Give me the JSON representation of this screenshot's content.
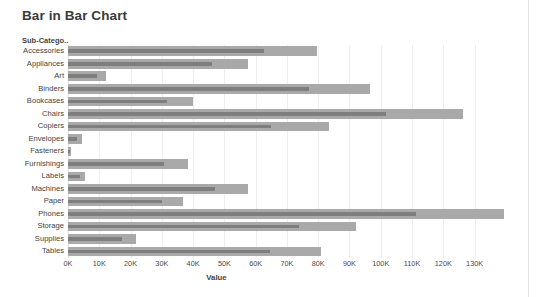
{
  "window": {
    "background": "#ffffff",
    "frame_border_color": "#e3e3e3"
  },
  "header": {
    "title": "Bar in Bar Chart"
  },
  "axis": {
    "category_header": "Sub-Catego..",
    "value_axis_title": "Value"
  },
  "colors": {
    "outer_bar": "#a9a9a9",
    "inner_bar": "#7e7e7e",
    "gridline": "#eceff1",
    "text": "#3f3f3f",
    "title_text": "#3b3b3b"
  },
  "chart_data": {
    "type": "bar",
    "orientation": "horizontal",
    "title": "Bar in Bar Chart",
    "xlabel": "Value",
    "ylabel": "Sub-Catego..",
    "xlim": [
      0,
      141000
    ],
    "grid": true,
    "legend": "none",
    "tick_labels": [
      "0K",
      "10K",
      "20K",
      "30K",
      "40K",
      "50K",
      "60K",
      "70K",
      "80K",
      "90K",
      "100K",
      "110K",
      "120K",
      "130K"
    ],
    "tick_values": [
      0,
      10000,
      20000,
      30000,
      40000,
      50000,
      60000,
      70000,
      80000,
      90000,
      100000,
      110000,
      120000,
      130000
    ],
    "categories": [
      "Accessories",
      "Appliances",
      "Art",
      "Binders",
      "Bookcases",
      "Chairs",
      "Copiers",
      "Envelopes",
      "Fasteners",
      "Furnishings",
      "Labels",
      "Machines",
      "Paper",
      "Phones",
      "Storage",
      "Supplies",
      "Tables"
    ],
    "series": [
      {
        "name": "Outer bar",
        "color": "#a9a9a9",
        "values": [
          79500,
          57400,
          12200,
          96500,
          40000,
          126300,
          83300,
          4500,
          1000,
          38500,
          5400,
          57700,
          36800,
          139400,
          92000,
          21800,
          80800
        ]
      },
      {
        "name": "Inner bar",
        "color": "#7e7e7e",
        "values": [
          62800,
          46200,
          9300,
          77000,
          31700,
          101600,
          65000,
          2900,
          600,
          30800,
          3800,
          47100,
          30100,
          111200,
          73700,
          17300,
          64700
        ]
      }
    ]
  }
}
